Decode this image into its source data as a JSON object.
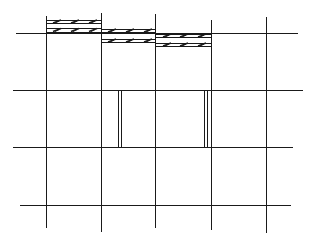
{
  "diagram": {
    "type": "structural-grid-plan",
    "background": "#ffffff",
    "stroke_color": "#1a1a1a",
    "grid": {
      "vertical_lines": [
        {
          "x": 46,
          "y1": 16,
          "y2": 228
        },
        {
          "x": 101,
          "y1": 13,
          "y2": 232
        },
        {
          "x": 155,
          "y1": 14,
          "y2": 228
        },
        {
          "x": 211,
          "y1": 20,
          "y2": 230
        },
        {
          "x": 266,
          "y1": 17,
          "y2": 233
        }
      ],
      "horizontal_lines": [
        {
          "y": 33,
          "x1": 16,
          "x2": 298
        },
        {
          "y": 90,
          "x1": 13,
          "x2": 303
        },
        {
          "y": 147,
          "x1": 13,
          "x2": 293
        },
        {
          "y": 205,
          "x1": 20,
          "x2": 291
        }
      ]
    },
    "hatched_bands": [
      {
        "x1": 46,
        "x2": 101,
        "lines_y": [
          20,
          23,
          28,
          32
        ],
        "marks_y": [
          21.5,
          30
        ],
        "marks_x": [
          57,
          75,
          93
        ]
      },
      {
        "x1": 101,
        "x2": 155,
        "lines_y": [
          29,
          32,
          39,
          42
        ],
        "marks_y": [
          30.5,
          40.5
        ],
        "marks_x": [
          112,
          130,
          148
        ]
      },
      {
        "x1": 155,
        "x2": 211,
        "lines_y": [
          34,
          37,
          43,
          46
        ],
        "marks_y": [
          35.5,
          44.5
        ],
        "marks_x": [
          167,
          184,
          202
        ]
      }
    ],
    "double_posts": [
      {
        "x_a": 118,
        "x_b": 121,
        "y1": 91,
        "y2": 147
      },
      {
        "x_a": 204,
        "x_b": 207,
        "y1": 91,
        "y2": 147
      }
    ]
  }
}
